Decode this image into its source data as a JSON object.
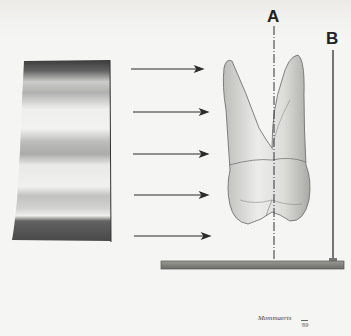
{
  "figure": {
    "labels": {
      "a": "A",
      "b": "B"
    },
    "signature": {
      "name": "Mommaerts",
      "year": "'69"
    },
    "elements": {
      "film": "shaded radiographic film/source panel",
      "arrows": 5,
      "tooth": "two-rooted tooth (lateral view)",
      "line_a": "dashed vertical axis A",
      "line_b": "vertical rod B",
      "base": "horizontal base plate"
    },
    "colors": {
      "background": "#f5f5f3",
      "ink": "#222222",
      "base_plate": "#7a7a74"
    }
  }
}
